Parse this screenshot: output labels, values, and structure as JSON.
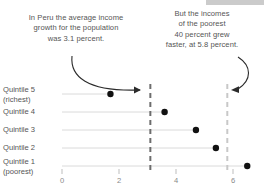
{
  "decor": {
    "topbar_color": "#b9b9b9"
  },
  "annotations": {
    "left": {
      "name": "average-growth-annotation",
      "lines": [
        "In Peru the average income",
        "growth for the population",
        "was 3.1 percent."
      ]
    },
    "right": {
      "name": "poorest-growth-annotation",
      "lines": [
        "But the incomes",
        "of the poorest",
        "40 percent grew",
        "faster, at 5.8 percent."
      ]
    }
  },
  "chart_data": {
    "type": "scatter",
    "title": "",
    "subtitle": "",
    "xlabel": "",
    "ylabel": "",
    "xlim": [
      0,
      6.8
    ],
    "grid": false,
    "legend_position": "none",
    "categories": [
      "Quintile 5 (richest)",
      "Quintile 4",
      "Quintile 3",
      "Quintile 2",
      "Quintile 1 (poorest)"
    ],
    "category_lines": [
      [
        "Quintile 5",
        "(richest)"
      ],
      [
        "Quintile 4"
      ],
      [
        "Quintile 3"
      ],
      [
        "Quintile 2"
      ],
      [
        "Quintile 1",
        "(poorest)"
      ]
    ],
    "values": [
      1.7,
      3.6,
      4.7,
      5.4,
      6.5
    ],
    "xticks": [
      0,
      2,
      4,
      6
    ],
    "xtick_labels": [
      "0",
      "2",
      "4",
      "6"
    ],
    "reference_lines": [
      {
        "label": "average 3.1 percent",
        "value": 3.1
      },
      {
        "label": "poorest 40 percent, 5.8 percent",
        "value": 5.8
      }
    ],
    "colors": {
      "dot": "#111111",
      "lollipop_line": "#d6d6d6",
      "reference_line": "#6d6d6d",
      "reference_line_light": "#c8c8c8",
      "axis_text": "#8a8a8a",
      "label_text": "#555555"
    }
  }
}
